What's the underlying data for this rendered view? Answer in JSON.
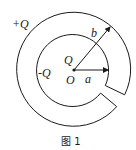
{
  "diagram": {
    "labels": {
      "outer_charge": "+Q",
      "inner_shell_charge": "-Q",
      "center_charge": "Q",
      "center_point": "O",
      "inner_radius": "a",
      "outer_radius": "b"
    },
    "caption": "图 1",
    "colors": {
      "stroke": "#1a1a1a",
      "background": "#ffffff"
    }
  }
}
